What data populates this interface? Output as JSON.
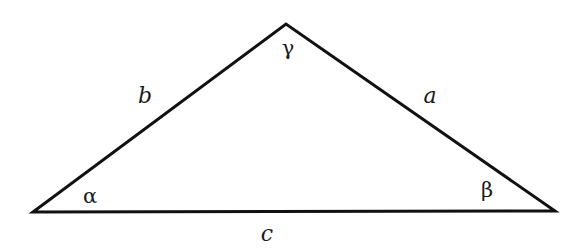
{
  "diagram": {
    "type": "triangle",
    "stroke_color": "#111111",
    "vertices": {
      "A": {
        "x": 33,
        "y": 212
      },
      "B": {
        "x": 555,
        "y": 211
      },
      "C": {
        "x": 286,
        "y": 24
      }
    },
    "sides": [
      {
        "id": "a",
        "label": "a",
        "between": [
          "B",
          "C"
        ],
        "pos": {
          "x": 430,
          "y": 96
        }
      },
      {
        "id": "b",
        "label": "b",
        "between": [
          "A",
          "C"
        ],
        "pos": {
          "x": 145,
          "y": 96
        }
      },
      {
        "id": "c",
        "label": "c",
        "between": [
          "A",
          "B"
        ],
        "pos": {
          "x": 267,
          "y": 234
        }
      }
    ],
    "angles": [
      {
        "id": "alpha",
        "label": "α",
        "vertex": "A",
        "pos": {
          "x": 90,
          "y": 196
        }
      },
      {
        "id": "beta",
        "label": "β",
        "vertex": "B",
        "pos": {
          "x": 487,
          "y": 190
        }
      },
      {
        "id": "gamma",
        "label": "γ",
        "vertex": "C",
        "pos": {
          "x": 288,
          "y": 48
        }
      }
    ]
  }
}
